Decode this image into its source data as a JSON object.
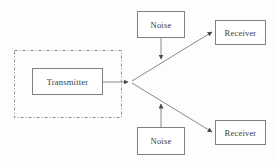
{
  "diagram": {
    "background_color": "#fdfdfc",
    "line_color": "#7a7a7a",
    "box_border_color": "#808080",
    "text_color": "#3b3b3b",
    "nodes": [
      {
        "id": "transmitter",
        "label": "Transmitter",
        "shape": "rectangle",
        "x": 32,
        "y": 68,
        "w": 71,
        "h": 27
      },
      {
        "id": "noise-top",
        "label": "Noise",
        "shape": "rectangle",
        "x": 137,
        "y": 11,
        "w": 48,
        "h": 27
      },
      {
        "id": "noise-bottom",
        "label": "Noise",
        "shape": "rectangle",
        "x": 137,
        "y": 127,
        "w": 48,
        "h": 28
      },
      {
        "id": "receiver-top",
        "label": "Receiver",
        "shape": "rectangle",
        "x": 215,
        "y": 20,
        "w": 51,
        "h": 25
      },
      {
        "id": "receiver-bottom",
        "label": "Receiver",
        "shape": "rectangle",
        "x": 215,
        "y": 120,
        "w": 51,
        "h": 25
      }
    ],
    "groups": [
      {
        "id": "transmitter-group",
        "label": "",
        "style": "dash-dot",
        "x": 14,
        "y": 50,
        "w": 108,
        "h": 68
      }
    ],
    "edges": [
      {
        "id": "transmitter-to-junction",
        "from": "transmitter",
        "to": "junction",
        "arrowhead": true
      },
      {
        "id": "junction-to-receiver-top",
        "from": "junction",
        "to": "receiver-top",
        "arrowhead": true
      },
      {
        "id": "junction-to-receiver-bottom",
        "from": "junction",
        "to": "receiver-bottom",
        "arrowhead": true
      },
      {
        "id": "noise-top-to-upper-path",
        "from": "noise-top",
        "to": "junction-to-receiver-top",
        "arrowhead": true
      },
      {
        "id": "noise-bottom-to-lower-path",
        "from": "noise-bottom",
        "to": "junction-to-receiver-bottom",
        "arrowhead": true
      }
    ],
    "junction": {
      "id": "junction",
      "x": 131,
      "y": 82
    }
  }
}
